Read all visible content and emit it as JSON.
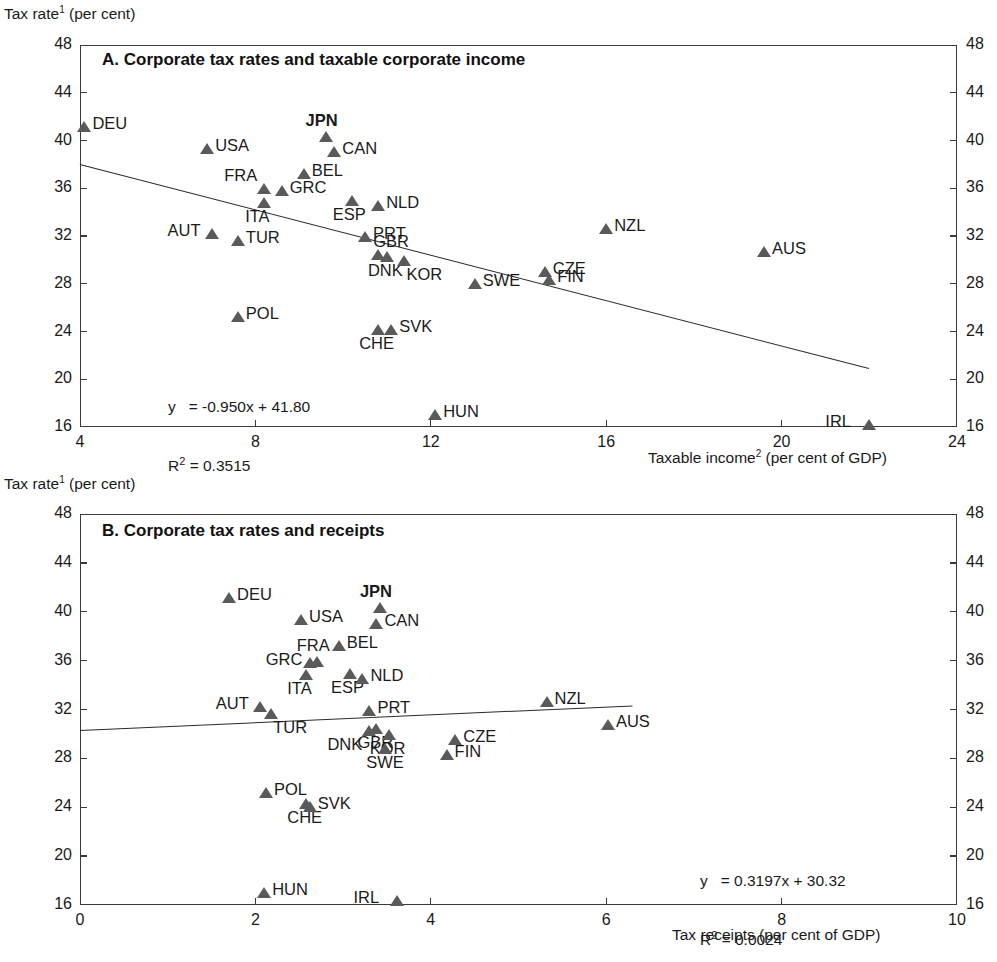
{
  "figure": {
    "y_axis_title": "Tax rate¹ (per cent)"
  },
  "panelA": {
    "title": "A. Corporate tax rates and taxable corporate income",
    "x_caption": "Taxable income² (per cent of GDP)",
    "equation_line1": "y   = -0.950x + 41.80",
    "equation_line2_prefix": "R",
    "equation_line2_sup": "2",
    "equation_line2_rest": " = 0.3515"
  },
  "panelB": {
    "title": "B. Corporate tax rates and receipts",
    "x_caption": "Tax receipts (per cent of GDP)",
    "equation_line1": "y   = 0.3197x + 30.32",
    "equation_line2_prefix": "R",
    "equation_line2_sup": "2",
    "equation_line2_rest": " = 0.0024"
  },
  "chart_data": [
    {
      "type": "scatter",
      "panel": "A",
      "title": "A. Corporate tax rates and taxable corporate income",
      "xlabel": "Taxable income² (per cent of GDP)",
      "ylabel": "Tax rate¹ (per cent)",
      "xlim": [
        4,
        24
      ],
      "ylim": [
        16,
        48
      ],
      "xticks": [
        4,
        8,
        12,
        16,
        20,
        24
      ],
      "yticks": [
        16,
        20,
        24,
        28,
        32,
        36,
        40,
        44,
        48
      ],
      "grid": false,
      "legend": "none",
      "marker": "triangle",
      "marker_color": "#5a5a5a",
      "trendline": {
        "slope": -0.95,
        "intercept": 41.8,
        "r_squared": 0.3515,
        "label": "y   = -0.950x + 41.80",
        "x_start": 4.0,
        "x_end": 22.0
      },
      "points": [
        {
          "code": "DEU",
          "x": 4.1,
          "y": 41.1,
          "label_side": "right",
          "bold": false
        },
        {
          "code": "USA",
          "x": 6.9,
          "y": 39.3,
          "label_side": "right",
          "bold": false
        },
        {
          "code": "JPN",
          "x": 9.6,
          "y": 40.3,
          "label_side": "above",
          "bold": true
        },
        {
          "code": "CAN",
          "x": 9.8,
          "y": 39.0,
          "label_side": "right",
          "bold": false
        },
        {
          "code": "BEL",
          "x": 9.1,
          "y": 37.2,
          "label_side": "right",
          "bold": false
        },
        {
          "code": "FRA",
          "x": 8.2,
          "y": 35.9,
          "label_side": "above-left",
          "bold": false
        },
        {
          "code": "GRC",
          "x": 8.6,
          "y": 35.8,
          "label_side": "right",
          "bold": false
        },
        {
          "code": "ITA",
          "x": 8.2,
          "y": 34.8,
          "label_side": "below",
          "bold": false
        },
        {
          "code": "ESP",
          "x": 10.2,
          "y": 34.9,
          "label_side": "below",
          "bold": false
        },
        {
          "code": "NLD",
          "x": 10.8,
          "y": 34.5,
          "label_side": "right",
          "bold": false
        },
        {
          "code": "AUT",
          "x": 7.0,
          "y": 32.2,
          "label_side": "left",
          "bold": false
        },
        {
          "code": "TUR",
          "x": 7.6,
          "y": 31.6,
          "label_side": "right",
          "bold": false
        },
        {
          "code": "PRT",
          "x": 10.5,
          "y": 31.9,
          "label_side": "right",
          "bold": false
        },
        {
          "code": "GBR",
          "x": 10.8,
          "y": 30.4,
          "label_side": "above-right",
          "bold": false
        },
        {
          "code": "DNK",
          "x": 11.0,
          "y": 30.2,
          "label_side": "below",
          "bold": false
        },
        {
          "code": "KOR",
          "x": 11.4,
          "y": 29.9,
          "label_side": "below-right",
          "bold": false
        },
        {
          "code": "SWE",
          "x": 13.0,
          "y": 28.0,
          "label_side": "right",
          "bold": false
        },
        {
          "code": "CZE",
          "x": 14.6,
          "y": 29.0,
          "label_side": "right",
          "bold": false
        },
        {
          "code": "FIN",
          "x": 14.7,
          "y": 28.3,
          "label_side": "right",
          "bold": false
        },
        {
          "code": "NZL",
          "x": 16.0,
          "y": 32.6,
          "label_side": "right",
          "bold": false
        },
        {
          "code": "AUS",
          "x": 19.6,
          "y": 30.7,
          "label_side": "right",
          "bold": false
        },
        {
          "code": "POL",
          "x": 7.6,
          "y": 25.2,
          "label_side": "right",
          "bold": false
        },
        {
          "code": "CHE",
          "x": 10.8,
          "y": 24.1,
          "label_side": "below",
          "bold": false
        },
        {
          "code": "SVK",
          "x": 11.1,
          "y": 24.1,
          "label_side": "right",
          "bold": false
        },
        {
          "code": "HUN",
          "x": 12.1,
          "y": 17.0,
          "label_side": "right",
          "bold": false
        },
        {
          "code": "IRL",
          "x": 22.0,
          "y": 16.2,
          "label_side": "left",
          "bold": false
        }
      ]
    },
    {
      "type": "scatter",
      "panel": "B",
      "title": "B. Corporate tax rates and receipts",
      "xlabel": "Tax receipts (per cent of GDP)",
      "ylabel": "Tax rate¹ (per cent)",
      "xlim": [
        0,
        10
      ],
      "ylim": [
        16,
        48
      ],
      "xticks": [
        0,
        2,
        4,
        6,
        8,
        10
      ],
      "yticks": [
        16,
        20,
        24,
        28,
        32,
        36,
        40,
        44,
        48
      ],
      "grid": false,
      "legend": "none",
      "marker": "triangle",
      "marker_color": "#5a5a5a",
      "trendline": {
        "slope": 0.3197,
        "intercept": 30.32,
        "r_squared": 0.0024,
        "label": "y   = 0.3197x + 30.32",
        "x_start": 0.0,
        "x_end": 6.3
      },
      "points": [
        {
          "code": "DEU",
          "x": 1.7,
          "y": 41.1,
          "label_side": "right",
          "bold": false
        },
        {
          "code": "USA",
          "x": 2.52,
          "y": 39.3,
          "label_side": "right",
          "bold": false
        },
        {
          "code": "JPN",
          "x": 3.42,
          "y": 40.3,
          "label_side": "above",
          "bold": true
        },
        {
          "code": "CAN",
          "x": 3.38,
          "y": 39.0,
          "label_side": "right",
          "bold": false
        },
        {
          "code": "BEL",
          "x": 2.95,
          "y": 37.2,
          "label_side": "right",
          "bold": false
        },
        {
          "code": "FRA",
          "x": 2.7,
          "y": 35.9,
          "label_side": "above",
          "bold": false
        },
        {
          "code": "GRC",
          "x": 2.62,
          "y": 35.8,
          "label_side": "left",
          "bold": false
        },
        {
          "code": "ITA",
          "x": 2.58,
          "y": 34.8,
          "label_side": "below",
          "bold": false
        },
        {
          "code": "ESP",
          "x": 3.08,
          "y": 34.9,
          "label_side": "below",
          "bold": false
        },
        {
          "code": "NLD",
          "x": 3.22,
          "y": 34.5,
          "label_side": "right",
          "bold": false
        },
        {
          "code": "AUT",
          "x": 2.05,
          "y": 32.2,
          "label_side": "left",
          "bold": false
        },
        {
          "code": "TUR",
          "x": 2.18,
          "y": 31.6,
          "label_side": "below-right",
          "bold": false
        },
        {
          "code": "PRT",
          "x": 3.3,
          "y": 31.9,
          "label_side": "right",
          "bold": false
        },
        {
          "code": "GBR",
          "x": 3.38,
          "y": 30.4,
          "label_side": "below",
          "bold": false
        },
        {
          "code": "DNK",
          "x": 3.3,
          "y": 30.2,
          "label_side": "below-left",
          "bold": false
        },
        {
          "code": "KOR",
          "x": 3.52,
          "y": 29.9,
          "label_side": "below",
          "bold": false
        },
        {
          "code": "SWE",
          "x": 3.48,
          "y": 28.8,
          "label_side": "below",
          "bold": false
        },
        {
          "code": "CZE",
          "x": 4.28,
          "y": 29.5,
          "label_side": "right",
          "bold": false
        },
        {
          "code": "FIN",
          "x": 4.18,
          "y": 28.3,
          "label_side": "right",
          "bold": false
        },
        {
          "code": "NZL",
          "x": 5.32,
          "y": 32.6,
          "label_side": "right",
          "bold": false
        },
        {
          "code": "AUS",
          "x": 6.02,
          "y": 30.7,
          "label_side": "right",
          "bold": false
        },
        {
          "code": "POL",
          "x": 2.12,
          "y": 25.2,
          "label_side": "right",
          "bold": false
        },
        {
          "code": "CHE",
          "x": 2.58,
          "y": 24.3,
          "label_side": "below",
          "bold": false
        },
        {
          "code": "SVK",
          "x": 2.62,
          "y": 24.0,
          "label_side": "right",
          "bold": false
        },
        {
          "code": "HUN",
          "x": 2.1,
          "y": 17.0,
          "label_side": "right",
          "bold": false
        },
        {
          "code": "IRL",
          "x": 3.62,
          "y": 16.3,
          "label_side": "left",
          "bold": false
        }
      ]
    }
  ]
}
